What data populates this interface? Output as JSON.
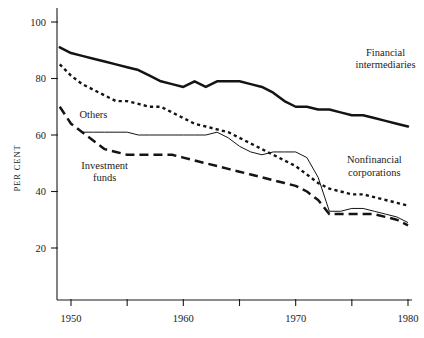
{
  "chart_data": {
    "type": "line",
    "title": "",
    "xlabel": "",
    "ylabel": "PER CENT",
    "xlim": [
      1948,
      1981
    ],
    "ylim": [
      0,
      105
    ],
    "grid": false,
    "legend_position": "inline-annotations",
    "x_ticks": [
      1950,
      1955,
      1960,
      1965,
      1970,
      1975,
      1980
    ],
    "x_tick_labels": [
      "1950",
      "",
      "1960",
      "",
      "1970",
      "",
      "1980"
    ],
    "y_ticks": [
      20,
      40,
      60,
      80,
      100
    ],
    "y_tick_labels": [
      "20",
      "40",
      "60",
      "80",
      "100"
    ],
    "x": [
      1949,
      1950,
      1951,
      1952,
      1953,
      1954,
      1955,
      1956,
      1957,
      1958,
      1959,
      1960,
      1961,
      1962,
      1963,
      1964,
      1965,
      1966,
      1967,
      1968,
      1969,
      1970,
      1971,
      1972,
      1973,
      1974,
      1975,
      1976,
      1977,
      1978,
      1979,
      1980
    ],
    "series": [
      {
        "name": "Financial intermediaries",
        "style": "solid-thick",
        "values": [
          91,
          89,
          88,
          87,
          86,
          85,
          84,
          83,
          81,
          79,
          78,
          77,
          79,
          77,
          79,
          79,
          79,
          78,
          77,
          75,
          72,
          70,
          70,
          69,
          69,
          68,
          67,
          67,
          66,
          65,
          64,
          63
        ]
      },
      {
        "name": "Nonfinancial corporations",
        "style": "dotted",
        "values": [
          85,
          81,
          78,
          76,
          74,
          72,
          72,
          71,
          70,
          70,
          68,
          66,
          64,
          63,
          62,
          61,
          59,
          57,
          55,
          53,
          51,
          49,
          46,
          43,
          41,
          40,
          39,
          39,
          38,
          37,
          36,
          35
        ]
      },
      {
        "name": "Others",
        "style": "thin-solid",
        "values": [
          null,
          null,
          61,
          61,
          61,
          61,
          61,
          60,
          60,
          60,
          60,
          60,
          60,
          60,
          61,
          59,
          56,
          54,
          53,
          54,
          54,
          54,
          52,
          45,
          33,
          33,
          34,
          34,
          33,
          32,
          31,
          29
        ]
      },
      {
        "name": "Investment funds",
        "style": "dashed",
        "values": [
          70,
          64,
          61,
          58,
          55,
          54,
          53,
          53,
          53,
          53,
          53,
          52,
          51,
          50,
          49,
          48,
          47,
          46,
          45,
          44,
          43,
          42,
          40,
          37,
          32,
          32,
          32,
          32,
          32,
          31,
          30,
          28
        ]
      }
    ],
    "annotations": [
      {
        "text_line1": "Financial",
        "text_line2": "intermediaries",
        "anchor_x": 1978,
        "anchor_y": 88
      },
      {
        "text_line1": "Nonfinancial",
        "text_line2": "corporations",
        "anchor_x": 1977,
        "anchor_y": 50
      },
      {
        "text_line1": "Others",
        "text_line2": "",
        "anchor_x": 1952,
        "anchor_y": 66
      },
      {
        "text_line1": "Investment",
        "text_line2": "funds",
        "anchor_x": 1953,
        "anchor_y": 48
      }
    ],
    "colors": {
      "line": "#141414",
      "axis": "#1b1b1b",
      "background": "#ffffff"
    }
  }
}
